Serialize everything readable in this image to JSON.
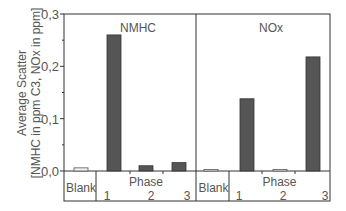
{
  "chart_data": {
    "type": "bar",
    "ylabel_line1": "Average Scatter",
    "ylabel_line2": "[NMHC in ppm C3, NOx in ppm]",
    "ylim": [
      0,
      0.3
    ],
    "yticks": [
      {
        "value": 0.0,
        "label": "0,0"
      },
      {
        "value": 0.1,
        "label": "0,1"
      },
      {
        "value": 0.2,
        "label": "0,2"
      },
      {
        "value": 0.3,
        "label": "0,3"
      }
    ],
    "y_minor_step": 0.05,
    "grid": false,
    "panels": [
      {
        "title": "NMHC",
        "blank_label": "Blank",
        "group_label": "Phase",
        "categories": [
          "Blank",
          "1",
          "2",
          "3"
        ],
        "values": [
          0.006,
          0.26,
          0.01,
          0.016
        ],
        "styles": [
          "light",
          "dark",
          "dark",
          "dark"
        ]
      },
      {
        "title": "NOx",
        "blank_label": "Blank",
        "group_label": "Phase",
        "categories": [
          "Blank",
          "1",
          "2",
          "3"
        ],
        "values": [
          0.003,
          0.138,
          0.003,
          0.218
        ],
        "styles": [
          "light",
          "dark",
          "light",
          "dark"
        ]
      }
    ],
    "colors": {
      "dark_bar": "#555555",
      "light_bar": "#f2f2f2",
      "axis": "#333333",
      "text": "#555555"
    }
  }
}
